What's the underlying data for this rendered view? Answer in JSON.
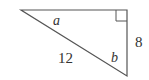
{
  "diagram": {
    "type": "right-triangle",
    "colors": {
      "stroke": "#555555",
      "text": "#333333"
    },
    "labels": {
      "angle_a": "a",
      "angle_b": "b",
      "hypotenuse": "12",
      "vertical_leg": "8"
    },
    "right_angle_marker": true
  }
}
